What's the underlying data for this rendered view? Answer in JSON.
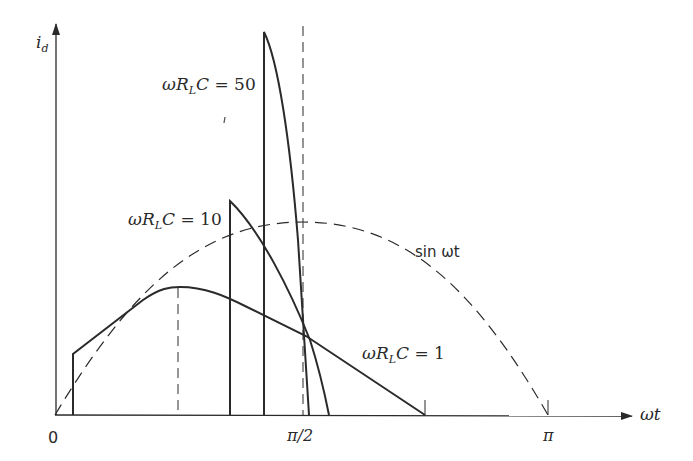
{
  "figure": {
    "type": "rectifier-diode-current-waveforms",
    "y_axis_label": "i_d",
    "x_axis_label": "ωt",
    "x_ticks": [
      {
        "label": "0",
        "x": 55
      },
      {
        "label": "π/2",
        "x": 303
      },
      {
        "label": "π",
        "x": 548
      }
    ],
    "curves": [
      {
        "name": "sin ωt",
        "style": "dashed",
        "label": "sin ωt"
      },
      {
        "name": "ωR_LC = 1",
        "style": "solid",
        "label": "ωR_LC = 1"
      },
      {
        "name": "ωR_LC = 10",
        "style": "solid",
        "label": "ωR_LC = 10"
      },
      {
        "name": "ωR_LC = 50",
        "style": "solid",
        "label": "ωR_LC = 50"
      }
    ],
    "labels": {
      "sin": "sin ωt",
      "rlc1_value": "1",
      "rlc10_value": "10",
      "rlc50_value": "50",
      "omega": "ω",
      "R": "R",
      "L": "L",
      "C": "C",
      "equals": " = "
    },
    "colors": {
      "ink": "#2a2a2a",
      "background": "#ffffff"
    }
  }
}
